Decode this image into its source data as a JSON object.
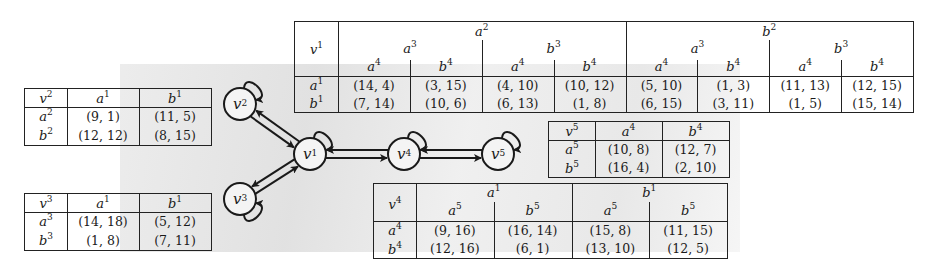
{
  "graph": {
    "nodes": [
      {
        "id": "v1",
        "base": "v",
        "sup": "1",
        "x": 310,
        "y": 154
      },
      {
        "id": "v2",
        "base": "v",
        "sup": "2",
        "x": 240,
        "y": 104
      },
      {
        "id": "v3",
        "base": "v",
        "sup": "3",
        "x": 240,
        "y": 199
      },
      {
        "id": "v4",
        "base": "v",
        "sup": "4",
        "x": 404,
        "y": 154
      },
      {
        "id": "v5",
        "base": "v",
        "sup": "5",
        "x": 498,
        "y": 154
      }
    ],
    "edges": [
      [
        "v1",
        "v2"
      ],
      [
        "v2",
        "v1"
      ],
      [
        "v1",
        "v3"
      ],
      [
        "v3",
        "v1"
      ],
      [
        "v1",
        "v4"
      ],
      [
        "v4",
        "v1"
      ],
      [
        "v4",
        "v5"
      ],
      [
        "v5",
        "v4"
      ]
    ],
    "self_loops": [
      "v1",
      "v2",
      "v3",
      "v4",
      "v5"
    ]
  },
  "tables": {
    "v1": {
      "corner": {
        "base": "v",
        "sup": "1"
      },
      "level1": [
        {
          "base": "a",
          "sup": "2"
        },
        {
          "base": "b",
          "sup": "2"
        }
      ],
      "level2": [
        {
          "base": "a",
          "sup": "3"
        },
        {
          "base": "b",
          "sup": "3"
        },
        {
          "base": "a",
          "sup": "3"
        },
        {
          "base": "b",
          "sup": "3"
        }
      ],
      "level3": [
        {
          "base": "a",
          "sup": "4"
        },
        {
          "base": "b",
          "sup": "4"
        },
        {
          "base": "a",
          "sup": "4"
        },
        {
          "base": "b",
          "sup": "4"
        },
        {
          "base": "a",
          "sup": "4"
        },
        {
          "base": "b",
          "sup": "4"
        },
        {
          "base": "a",
          "sup": "4"
        },
        {
          "base": "b",
          "sup": "4"
        }
      ],
      "rows": [
        {
          "label": {
            "base": "a",
            "sup": "1"
          },
          "cells": [
            "(14, 4)",
            "(3, 15)",
            "(4, 10)",
            "(10, 12)",
            "(5, 10)",
            "(1, 3)",
            "(11, 13)",
            "(12, 15)"
          ]
        },
        {
          "label": {
            "base": "b",
            "sup": "1"
          },
          "cells": [
            "(7, 14)",
            "(10, 6)",
            "(6, 13)",
            "(1, 8)",
            "(6, 15)",
            "(3, 11)",
            "(1, 5)",
            "(15, 14)"
          ]
        }
      ]
    },
    "v2": {
      "corner": {
        "base": "v",
        "sup": "2"
      },
      "cols": [
        {
          "base": "a",
          "sup": "1"
        },
        {
          "base": "b",
          "sup": "1"
        }
      ],
      "rows": [
        {
          "label": {
            "base": "a",
            "sup": "2"
          },
          "cells": [
            "(9, 1)",
            "(11, 5)"
          ]
        },
        {
          "label": {
            "base": "b",
            "sup": "2"
          },
          "cells": [
            "(12, 12)",
            "(8, 15)"
          ]
        }
      ]
    },
    "v3": {
      "corner": {
        "base": "v",
        "sup": "3"
      },
      "cols": [
        {
          "base": "a",
          "sup": "1"
        },
        {
          "base": "b",
          "sup": "1"
        }
      ],
      "rows": [
        {
          "label": {
            "base": "a",
            "sup": "3"
          },
          "cells": [
            "(14, 18)",
            "(5, 12)"
          ]
        },
        {
          "label": {
            "base": "b",
            "sup": "3"
          },
          "cells": [
            "(1, 8)",
            "(7, 11)"
          ]
        }
      ]
    },
    "v5": {
      "corner": {
        "base": "v",
        "sup": "5"
      },
      "cols": [
        {
          "base": "a",
          "sup": "4"
        },
        {
          "base": "b",
          "sup": "4"
        }
      ],
      "rows": [
        {
          "label": {
            "base": "a",
            "sup": "5"
          },
          "cells": [
            "(10, 8)",
            "(12, 7)"
          ]
        },
        {
          "label": {
            "base": "b",
            "sup": "5"
          },
          "cells": [
            "(16, 4)",
            "(2, 10)"
          ]
        }
      ]
    },
    "v4": {
      "corner": {
        "base": "v",
        "sup": "4"
      },
      "level1": [
        {
          "base": "a",
          "sup": "1"
        },
        {
          "base": "b",
          "sup": "1"
        }
      ],
      "level2": [
        {
          "base": "a",
          "sup": "5"
        },
        {
          "base": "b",
          "sup": "5"
        },
        {
          "base": "a",
          "sup": "5"
        },
        {
          "base": "b",
          "sup": "5"
        }
      ],
      "rows": [
        {
          "label": {
            "base": "a",
            "sup": "4"
          },
          "cells": [
            "(9, 16)",
            "(16, 14)",
            "(15, 8)",
            "(11, 15)"
          ]
        },
        {
          "label": {
            "base": "b",
            "sup": "4"
          },
          "cells": [
            "(12, 16)",
            "(6, 1)",
            "(13, 10)",
            "(12, 5)"
          ]
        }
      ]
    }
  }
}
